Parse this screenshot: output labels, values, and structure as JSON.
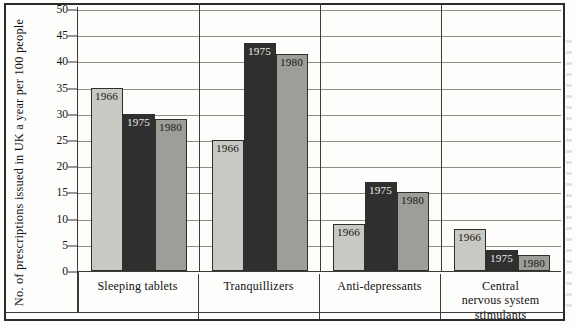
{
  "chart_data": {
    "type": "bar",
    "title": "",
    "xlabel": "",
    "ylabel": "No. of prescriptions issued in UK a year per 100 people",
    "ylim": [
      0,
      50
    ],
    "ytick_step": 5,
    "yticks": [
      50,
      45,
      40,
      35,
      30,
      25,
      20,
      15,
      10,
      5,
      0
    ],
    "ytick_labels": [
      "50",
      "45",
      "40",
      "35",
      "30",
      "25",
      "20",
      "15",
      "10",
      "5",
      "0"
    ],
    "grid": true,
    "legend": "none",
    "bar_labels_inside": true,
    "categories": [
      "Sleeping tablets",
      "Tranquillizers",
      "Anti-depressants",
      "Central nervous system stimulants"
    ],
    "category_label_lines": [
      [
        "Sleeping tablets"
      ],
      [
        "Tranquillizers"
      ],
      [
        "Anti-depressants"
      ],
      [
        "Central",
        "nervous system",
        "stimulants"
      ]
    ],
    "series": [
      {
        "name": "1966",
        "shade": "light",
        "color": "#c9c9c4",
        "values": [
          35,
          25,
          9,
          8
        ]
      },
      {
        "name": "1975",
        "shade": "dark",
        "color": "#2f2f2f",
        "values": [
          30,
          43.5,
          17,
          4
        ]
      },
      {
        "name": "1980",
        "shade": "medium",
        "color": "#9e9e99",
        "values": [
          29,
          41.5,
          15,
          3
        ]
      }
    ],
    "groups": [
      {
        "category": "Sleeping tablets",
        "bars": [
          {
            "year": "1966",
            "value": 35,
            "shade": "light"
          },
          {
            "year": "1975",
            "value": 30,
            "shade": "dark"
          },
          {
            "year": "1980",
            "value": 29,
            "shade": "medium"
          }
        ]
      },
      {
        "category": "Tranquillizers",
        "bars": [
          {
            "year": "1966",
            "value": 25,
            "shade": "light"
          },
          {
            "year": "1975",
            "value": 43.5,
            "shade": "dark"
          },
          {
            "year": "1980",
            "value": 41.5,
            "shade": "medium"
          }
        ]
      },
      {
        "category": "Anti-depressants",
        "bars": [
          {
            "year": "1966",
            "value": 9,
            "shade": "light"
          },
          {
            "year": "1975",
            "value": 17,
            "shade": "dark"
          },
          {
            "year": "1980",
            "value": 15,
            "shade": "medium"
          }
        ]
      },
      {
        "category": "Central nervous system stimulants",
        "bars": [
          {
            "year": "1966",
            "value": 8,
            "shade": "light"
          },
          {
            "year": "1975",
            "value": 4,
            "shade": "dark"
          },
          {
            "year": "1980",
            "value": 3,
            "shade": "medium"
          }
        ]
      }
    ],
    "colors": {
      "bar_light": "#c9c9c4",
      "bar_dark": "#2f2f2f",
      "bar_medium": "#9e9e99",
      "gridline": "#8d8d86",
      "axis": "#3a3a36",
      "frame": "#2b2b2b",
      "background": "#fdfdfb",
      "text": "#121212"
    }
  }
}
